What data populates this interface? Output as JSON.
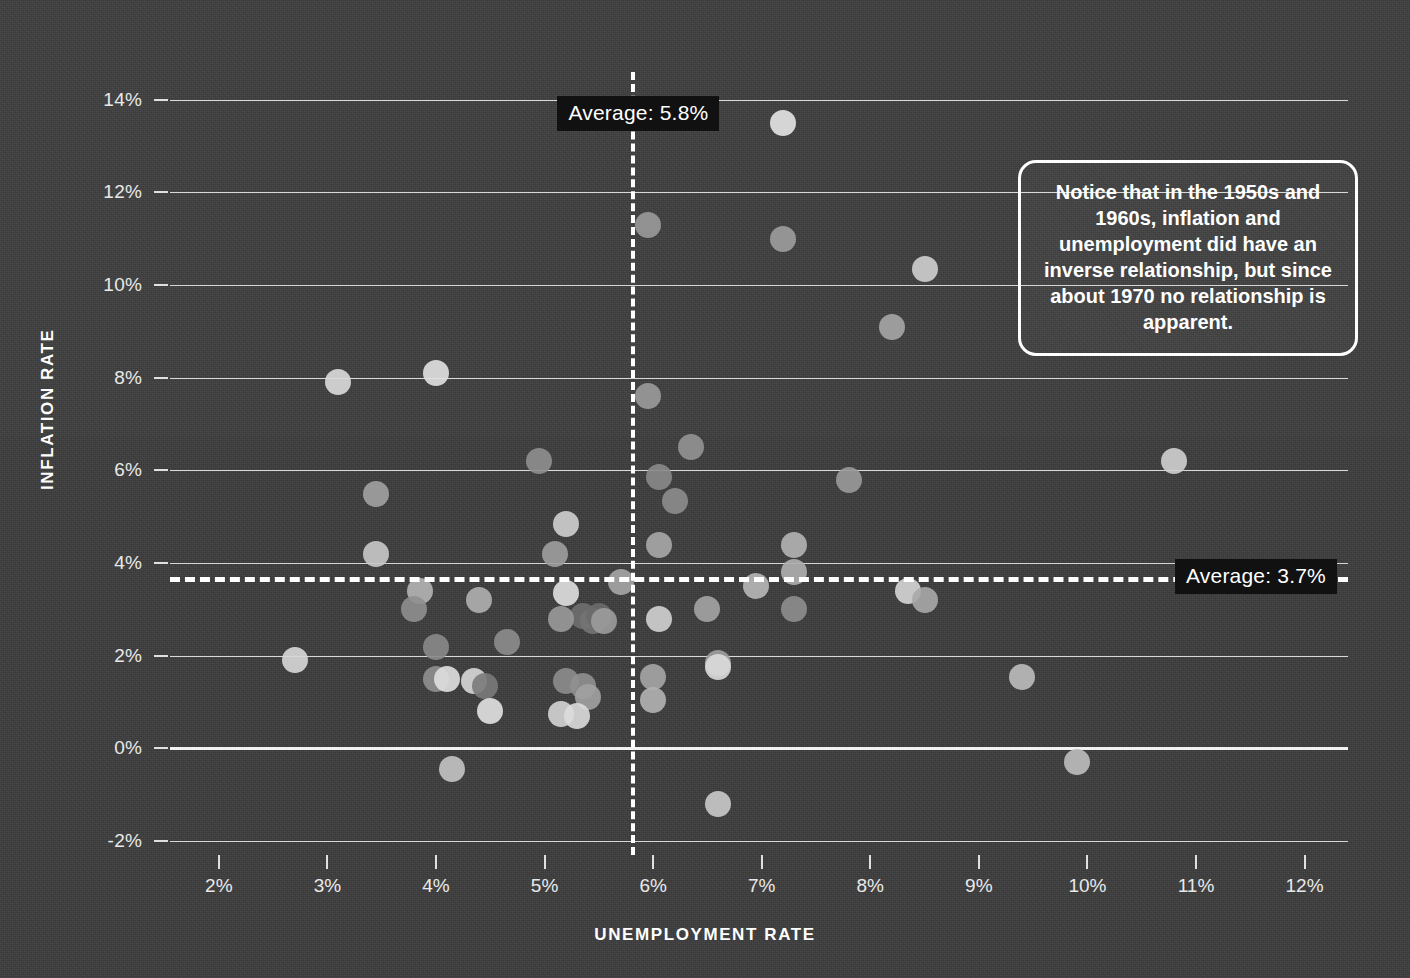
{
  "chart_data": {
    "type": "scatter",
    "title": "",
    "xlabel": "UNEMPLOYMENT RATE",
    "ylabel": "INFLATION RATE",
    "xlim": [
      1.55,
      12.4
    ],
    "ylim": [
      -2.3,
      14.6
    ],
    "xticks": [
      "2%",
      "3%",
      "4%",
      "5%",
      "6%",
      "7%",
      "8%",
      "9%",
      "10%",
      "11%",
      "12%"
    ],
    "xtick_values": [
      2,
      3,
      4,
      5,
      6,
      7,
      8,
      9,
      10,
      11,
      12
    ],
    "yticks": [
      "-2%",
      "0%",
      "2%",
      "4%",
      "6%",
      "8%",
      "10%",
      "12%",
      "14%"
    ],
    "ytick_values": [
      -2,
      0,
      2,
      4,
      6,
      8,
      10,
      12,
      14
    ],
    "grid": "horizontal",
    "legend": "none",
    "marker_radius_px": 13,
    "reference_lines": [
      {
        "name": "unemployment-average",
        "orientation": "vertical",
        "value": 5.8,
        "label": "Average: 5.8%",
        "style": "dashed",
        "color": "#ffffff"
      },
      {
        "name": "inflation-average",
        "orientation": "horizontal",
        "value": 3.7,
        "label": "Average: 3.7%",
        "style": "dashed",
        "color": "#ffffff"
      }
    ],
    "points": [
      {
        "x": 7.2,
        "y": 13.5,
        "shade": "#e6e6e6"
      },
      {
        "x": 5.95,
        "y": 11.3,
        "shade": "#9a9a9a"
      },
      {
        "x": 7.2,
        "y": 11.0,
        "shade": "#9d9d9d"
      },
      {
        "x": 8.5,
        "y": 10.35,
        "shade": "#cfcfcf"
      },
      {
        "x": 8.2,
        "y": 9.1,
        "shade": "#a6a6a6"
      },
      {
        "x": 3.1,
        "y": 7.9,
        "shade": "#dcdcdc"
      },
      {
        "x": 4.0,
        "y": 8.1,
        "shade": "#e2e2e2"
      },
      {
        "x": 5.95,
        "y": 7.6,
        "shade": "#9b9b9b"
      },
      {
        "x": 6.35,
        "y": 6.5,
        "shade": "#949494"
      },
      {
        "x": 4.95,
        "y": 6.2,
        "shade": "#8f8f8f"
      },
      {
        "x": 10.8,
        "y": 6.2,
        "shade": "#d0d0d0"
      },
      {
        "x": 6.05,
        "y": 5.85,
        "shade": "#8a8a8a"
      },
      {
        "x": 7.8,
        "y": 5.8,
        "shade": "#9a9a9a"
      },
      {
        "x": 6.2,
        "y": 5.35,
        "shade": "#8d8d8d"
      },
      {
        "x": 3.45,
        "y": 5.5,
        "shade": "#a2a2a2"
      },
      {
        "x": 5.2,
        "y": 4.85,
        "shade": "#cfcfcf"
      },
      {
        "x": 7.3,
        "y": 4.4,
        "shade": "#b4b4b4"
      },
      {
        "x": 6.05,
        "y": 4.4,
        "shade": "#a9a9a9"
      },
      {
        "x": 5.1,
        "y": 4.2,
        "shade": "#9e9e9e"
      },
      {
        "x": 3.45,
        "y": 4.2,
        "shade": "#c9c9c9"
      },
      {
        "x": 7.3,
        "y": 3.8,
        "shade": "#b0b0b0"
      },
      {
        "x": 5.7,
        "y": 3.6,
        "shade": "#a6a6a6"
      },
      {
        "x": 6.95,
        "y": 3.5,
        "shade": "#b8b8b8"
      },
      {
        "x": 8.35,
        "y": 3.4,
        "shade": "#d6d6d6"
      },
      {
        "x": 8.5,
        "y": 3.2,
        "shade": "#a8a8a8"
      },
      {
        "x": 3.85,
        "y": 3.4,
        "shade": "#b5b5b5"
      },
      {
        "x": 3.8,
        "y": 3.0,
        "shade": "#8f8f8f"
      },
      {
        "x": 4.4,
        "y": 3.2,
        "shade": "#b0b0b0"
      },
      {
        "x": 5.2,
        "y": 3.35,
        "shade": "#e0e0e0"
      },
      {
        "x": 5.35,
        "y": 2.85,
        "shade": "#6f6f6f"
      },
      {
        "x": 5.45,
        "y": 2.75,
        "shade": "#747474"
      },
      {
        "x": 5.5,
        "y": 2.85,
        "shade": "#6b6b6b"
      },
      {
        "x": 5.55,
        "y": 2.75,
        "shade": "#9c9c9c"
      },
      {
        "x": 5.15,
        "y": 2.8,
        "shade": "#9a9a9a"
      },
      {
        "x": 6.05,
        "y": 2.8,
        "shade": "#d2d2d2"
      },
      {
        "x": 6.5,
        "y": 3.0,
        "shade": "#a4a4a4"
      },
      {
        "x": 7.3,
        "y": 3.0,
        "shade": "#8e8e8e"
      },
      {
        "x": 4.65,
        "y": 2.3,
        "shade": "#8d8d8d"
      },
      {
        "x": 4.0,
        "y": 2.2,
        "shade": "#8a8a8a"
      },
      {
        "x": 2.7,
        "y": 1.9,
        "shade": "#d8d8d8"
      },
      {
        "x": 6.6,
        "y": 1.85,
        "shade": "#a0a0a0"
      },
      {
        "x": 6.6,
        "y": 1.75,
        "shade": "#dcdcdc"
      },
      {
        "x": 4.0,
        "y": 1.5,
        "shade": "#909090"
      },
      {
        "x": 4.1,
        "y": 1.5,
        "shade": "#e0e0e0"
      },
      {
        "x": 4.35,
        "y": 1.45,
        "shade": "#d8d8d8"
      },
      {
        "x": 4.45,
        "y": 1.35,
        "shade": "#7a7a7a"
      },
      {
        "x": 5.2,
        "y": 1.45,
        "shade": "#8d8d8d"
      },
      {
        "x": 5.35,
        "y": 1.35,
        "shade": "#909090"
      },
      {
        "x": 5.4,
        "y": 1.1,
        "shade": "#a2a2a2"
      },
      {
        "x": 6.0,
        "y": 1.55,
        "shade": "#a6a6a6"
      },
      {
        "x": 6.0,
        "y": 1.05,
        "shade": "#b2b2b2"
      },
      {
        "x": 4.5,
        "y": 0.8,
        "shade": "#e2e2e2"
      },
      {
        "x": 5.15,
        "y": 0.75,
        "shade": "#d4d4d4"
      },
      {
        "x": 5.3,
        "y": 0.7,
        "shade": "#dcdcdc"
      },
      {
        "x": 9.4,
        "y": 1.55,
        "shade": "#bdbdbd"
      },
      {
        "x": 4.15,
        "y": -0.45,
        "shade": "#c4c4c4"
      },
      {
        "x": 9.9,
        "y": -0.3,
        "shade": "#bebebe"
      },
      {
        "x": 6.6,
        "y": -1.2,
        "shade": "#cacaca"
      }
    ]
  },
  "annotation": {
    "text": "Notice that in the 1950s and 1960s, inflation and unemployment did have an inverse relationship, but since about 1970 no relationship is apparent."
  },
  "colors": {
    "background": "#3c3c3c",
    "gridline": "#d8d8d8",
    "axis": "#f2f2f2",
    "text": "#ffffff",
    "label_bg": "#111111"
  }
}
